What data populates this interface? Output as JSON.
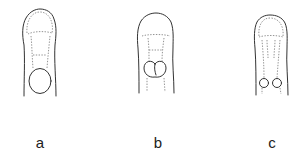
{
  "figure": {
    "panels": [
      {
        "id": "a",
        "label": "a",
        "description": "Elongated outline with large rounded apex, dashed neck and a single large basal circle",
        "label_x": 40,
        "label_y": 135
      },
      {
        "id": "b",
        "label": "b",
        "description": "Elongated outline with rounded apex, dashed neck and a heart-shaped bilobed basal body",
        "label_x": 158,
        "label_y": 135
      },
      {
        "id": "c",
        "label": "c",
        "description": "Elongated outline with rounded apex, dashed inner outline and two small paired basal circles",
        "label_x": 272,
        "label_y": 135
      }
    ]
  },
  "colors": {
    "background": "#ffffff",
    "line": "#333333",
    "dashed_line": "#777777",
    "label_text": "#222222"
  }
}
